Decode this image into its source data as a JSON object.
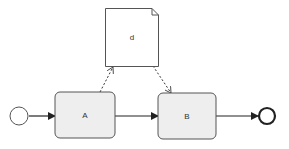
{
  "diagram": {
    "type": "bpmn-process",
    "start_event": {
      "label": ""
    },
    "tasks": [
      {
        "id": "A",
        "label": "A"
      },
      {
        "id": "B",
        "label": "B"
      }
    ],
    "data_object": {
      "label": "d"
    },
    "end_event": {
      "label": ""
    },
    "flows": [
      {
        "from": "start",
        "to": "A",
        "kind": "sequence"
      },
      {
        "from": "A",
        "to": "B",
        "kind": "sequence"
      },
      {
        "from": "B",
        "to": "end",
        "kind": "sequence"
      },
      {
        "from": "A",
        "to": "d",
        "kind": "data-association"
      },
      {
        "from": "d",
        "to": "B",
        "kind": "data-association"
      }
    ],
    "colors": {
      "stroke": "#333333",
      "task_fill": "#eeeeee",
      "data_fill": "#ffffff",
      "event_fill": "#ffffff"
    }
  }
}
